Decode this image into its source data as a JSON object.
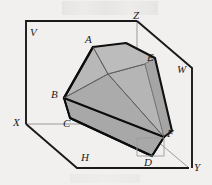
{
  "figure": {
    "title": "",
    "background_color": "#f2f0ee",
    "solid_fill": "#b0b0b0",
    "solid_fill_dark": "#9a9a9a",
    "solid_fill_light": "#bdbdbd",
    "outline_color": "#111111",
    "thin_line_color": "#8e8e8e",
    "box_line_color": "#1a1a1a"
  },
  "labels": {
    "V": "V",
    "Z": "Z",
    "W": "W",
    "X": "X",
    "H": "H",
    "Y": "Y",
    "A": "A",
    "B": "B",
    "C": "C",
    "D": "D",
    "E": "E",
    "F": "F"
  },
  "label_positions": {
    "V": {
      "x": 30,
      "y": 27
    },
    "Z": {
      "x": 133,
      "y": 11
    },
    "W": {
      "x": 177,
      "y": 65
    },
    "X": {
      "x": 13,
      "y": 117
    },
    "H": {
      "x": 81,
      "y": 152
    },
    "Y": {
      "x": 194,
      "y": 163
    },
    "A": {
      "x": 86,
      "y": 36
    },
    "B": {
      "x": 52,
      "y": 90
    },
    "C": {
      "x": 64,
      "y": 119
    },
    "D": {
      "x": 144,
      "y": 158
    },
    "E": {
      "x": 147,
      "y": 54
    },
    "F": {
      "x": 167,
      "y": 129
    }
  },
  "geometry": {
    "box_corners": {
      "top_left_V": {
        "x": 26,
        "y": 21
      },
      "top_right_Z": {
        "x": 137,
        "y": 21
      },
      "right_W": {
        "x": 192,
        "y": 68
      },
      "left_X": {
        "x": 26,
        "y": 124
      },
      "bottom_left_H": {
        "x": 77,
        "y": 168
      },
      "bottom_right_Y": {
        "x": 189,
        "y": 168
      }
    },
    "solid_vertices": {
      "A": {
        "x": 93,
        "y": 47
      },
      "B": {
        "x": 64,
        "y": 98
      },
      "C": {
        "x": 70,
        "y": 118
      },
      "D": {
        "x": 152,
        "y": 156
      },
      "E": {
        "x": 145,
        "y": 64
      },
      "F": {
        "x": 164,
        "y": 137
      },
      "interior_apex": {
        "x": 108,
        "y": 74
      }
    }
  }
}
